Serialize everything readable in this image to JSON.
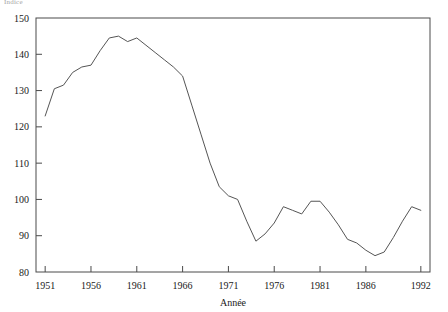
{
  "top_label": "Indice",
  "chart_data": {
    "type": "line",
    "title": "",
    "xlabel": "Année",
    "ylabel": "",
    "xlim": [
      1950,
      1993
    ],
    "ylim": [
      80,
      150
    ],
    "grid": false,
    "legend": false,
    "xticks": [
      1951,
      1956,
      1961,
      1966,
      1971,
      1976,
      1981,
      1986,
      1992
    ],
    "yticks": [
      80,
      90,
      100,
      110,
      120,
      130,
      140,
      150
    ],
    "line_color": "#555555",
    "series": [
      {
        "name": "Indice",
        "x": [
          1951,
          1952,
          1953,
          1954,
          1955,
          1956,
          1957,
          1958,
          1959,
          1960,
          1961,
          1962,
          1963,
          1964,
          1965,
          1966,
          1967,
          1968,
          1969,
          1970,
          1971,
          1972,
          1973,
          1974,
          1975,
          1976,
          1977,
          1978,
          1979,
          1980,
          1981,
          1982,
          1983,
          1984,
          1985,
          1986,
          1987,
          1988,
          1989,
          1990,
          1991,
          1992
        ],
        "values": [
          123.0,
          130.5,
          131.5,
          135.0,
          136.5,
          137.0,
          141.0,
          144.5,
          145.0,
          143.5,
          144.5,
          142.5,
          140.5,
          138.5,
          136.5,
          134.0,
          126.0,
          118.0,
          110.0,
          103.5,
          101.0,
          100.0,
          94.0,
          88.5,
          90.5,
          93.5,
          98.0,
          97.0,
          96.0,
          99.5,
          99.5,
          96.5,
          93.0,
          89.0,
          88.0,
          86.0,
          84.5,
          85.5,
          89.5,
          94.0,
          98.0,
          97.0
        ]
      }
    ]
  }
}
